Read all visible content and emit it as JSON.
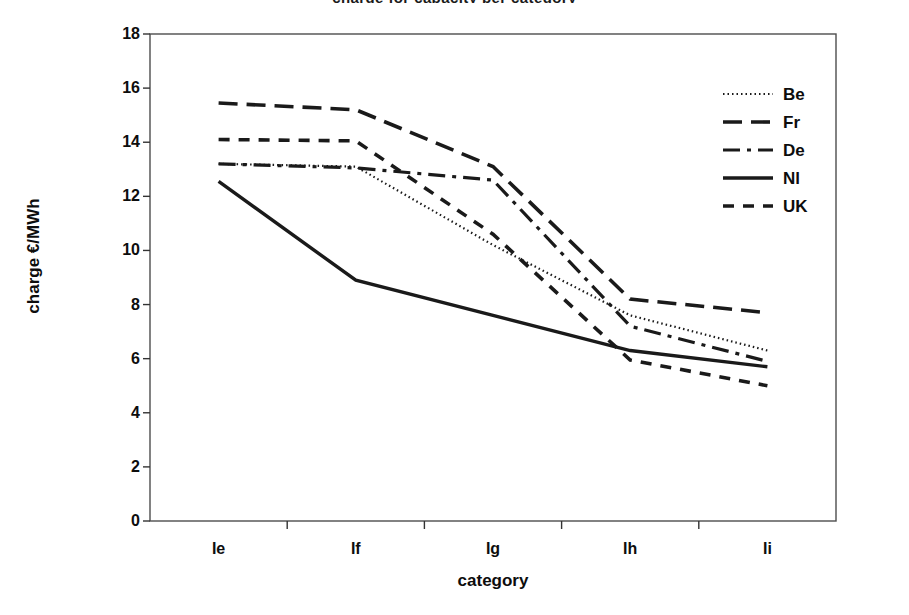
{
  "chart_data": {
    "type": "line",
    "title": "charge for capacity per category",
    "xlabel": "category",
    "ylabel": "charge €/MWh",
    "categories": [
      "Ie",
      "If",
      "Ig",
      "Ih",
      "Ii"
    ],
    "ylim": [
      0,
      18
    ],
    "y_ticks": [
      0,
      2,
      4,
      6,
      8,
      10,
      12,
      14,
      16,
      18
    ],
    "y_tick_labels": [
      "0",
      "2",
      "4",
      "6",
      "8",
      "10",
      "12",
      "14",
      "16",
      "18"
    ],
    "grid": false,
    "legend_position": "upper right",
    "series": [
      {
        "name": "Be",
        "style": "dotted",
        "color": "#1a1a1a",
        "values": [
          13.2,
          13.1,
          10.2,
          7.6,
          6.3
        ]
      },
      {
        "name": "Fr",
        "style": "long-dash",
        "color": "#1a1a1a",
        "values": [
          15.45,
          15.2,
          13.1,
          8.2,
          7.7
        ]
      },
      {
        "name": "De",
        "style": "dash-dot",
        "color": "#1a1a1a",
        "values": [
          13.2,
          13.05,
          12.6,
          7.2,
          5.9
        ]
      },
      {
        "name": "Nl",
        "style": "solid",
        "color": "#1a1a1a",
        "values": [
          12.55,
          8.9,
          7.6,
          6.3,
          5.7
        ]
      },
      {
        "name": "UK",
        "style": "dash",
        "color": "#1a1a1a",
        "values": [
          14.1,
          14.05,
          10.6,
          5.95,
          5.0
        ]
      }
    ]
  },
  "legend": {
    "items": [
      {
        "label": "Be"
      },
      {
        "label": "Fr"
      },
      {
        "label": "De"
      },
      {
        "label": "Nl"
      },
      {
        "label": "UK"
      }
    ]
  },
  "axes": {
    "plot_left": 150,
    "plot_right": 836,
    "plot_top": 34,
    "plot_bottom": 521
  }
}
